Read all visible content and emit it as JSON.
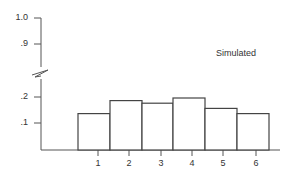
{
  "chart_data": {
    "type": "bar",
    "title": "",
    "annotation": "Simulated",
    "xlabel": "",
    "ylabel": "",
    "categories": [
      "1",
      "2",
      "3",
      "4",
      "5",
      "6"
    ],
    "values": [
      0.14,
      0.19,
      0.18,
      0.2,
      0.16,
      0.14
    ],
    "y_ticks": [
      ".1",
      ".2",
      ".9",
      "1.0"
    ],
    "y_axis_break": true,
    "ylim": [
      0,
      1.0
    ],
    "grid": false,
    "legend": null
  },
  "labels": {
    "annotation": "Simulated",
    "yticks": {
      "t10": "1.0",
      "t09": ".9",
      "t02": ".2",
      "t01": ".1"
    },
    "xticks": [
      "1",
      "2",
      "3",
      "4",
      "5",
      "6"
    ]
  }
}
